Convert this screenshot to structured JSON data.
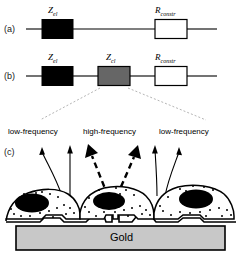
{
  "figure": {
    "panels": [
      {
        "id": "a",
        "label": "(a)"
      },
      {
        "id": "b",
        "label": "(b)"
      },
      {
        "id": "c",
        "label": "(c)"
      }
    ]
  },
  "circuit_a": {
    "panel_label": "(a)",
    "elements": [
      {
        "name": "electrode-impedance",
        "symbol": "Z",
        "subscript": "el",
        "fill": "#000000",
        "stroke": "#000000"
      },
      {
        "name": "constriction-resistance",
        "symbol": "R",
        "subscript": "constr",
        "fill": "#ffffff",
        "stroke": "#000000"
      }
    ]
  },
  "circuit_b": {
    "panel_label": "(b)",
    "elements": [
      {
        "name": "electrode-impedance",
        "symbol": "Z",
        "subscript": "el",
        "fill": "#000000",
        "stroke": "#000000"
      },
      {
        "name": "cell-layer-impedance",
        "symbol": "Z",
        "subscript": "cl",
        "fill": "#666666",
        "stroke": "#000000"
      },
      {
        "name": "constriction-resistance",
        "symbol": "R",
        "subscript": "constr",
        "fill": "#ffffff",
        "stroke": "#000000"
      }
    ]
  },
  "schematic_c": {
    "panel_label": "(c)",
    "frequency_labels": [
      {
        "name": "low-frequency-left",
        "text": "low-frequency"
      },
      {
        "name": "high-frequency-center",
        "text": "high-frequency"
      },
      {
        "name": "low-frequency-right",
        "text": "low-frequency"
      }
    ],
    "substrate": {
      "label": "Gold",
      "fill": "#c8c8c8",
      "stroke": "#000000"
    },
    "cells": [
      {
        "name": "cell-left"
      },
      {
        "name": "cell-center"
      },
      {
        "name": "cell-right"
      }
    ]
  },
  "colors": {
    "black": "#000000",
    "gray_element": "#666666",
    "white": "#ffffff",
    "gold_fill": "#c8c8c8",
    "leader_line": "#b0b0b0"
  }
}
